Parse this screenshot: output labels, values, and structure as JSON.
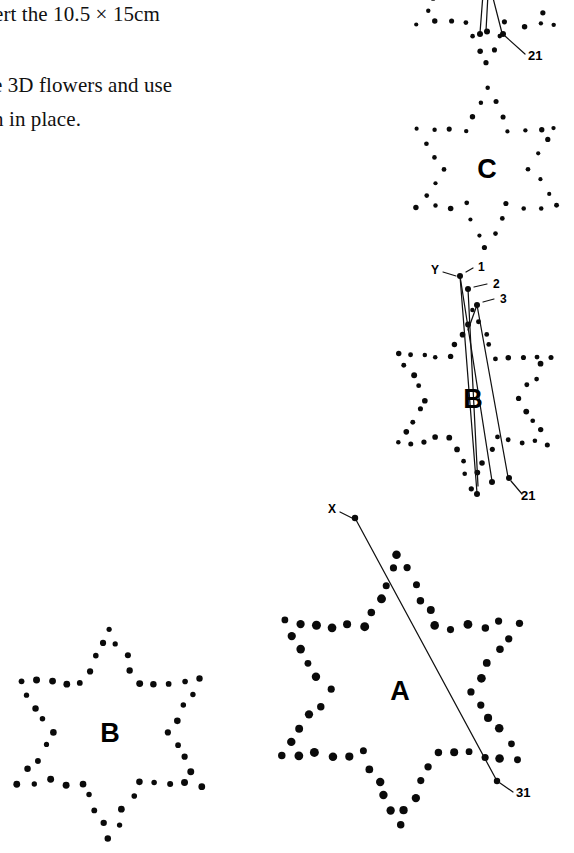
{
  "page": {
    "width": 574,
    "height": 853,
    "background": "#ffffff",
    "ink": "#0a0a0a"
  },
  "instructions": {
    "lines": [
      "ert the 10.5 × 15cm",
      "e 3D flowers and use",
      "n in place."
    ]
  },
  "shapes": [
    {
      "id": "star-top",
      "letter": "",
      "center": {
        "x": 487,
        "y": -14
      },
      "radius_outer": 78,
      "radius_inner": 42,
      "label_visible": false
    },
    {
      "id": "star-c",
      "letter": "C",
      "center": {
        "x": 487,
        "y": 168
      },
      "radius_outer": 80,
      "radius_inner": 43,
      "label_visible": true
    },
    {
      "id": "star-b-right",
      "letter": "B",
      "center": {
        "x": 473,
        "y": 398
      },
      "radius_outer": 88,
      "radius_inner": 47,
      "label_visible": true
    },
    {
      "id": "star-a",
      "letter": "A",
      "center": {
        "x": 400,
        "y": 690
      },
      "radius_outer": 135,
      "radius_inner": 72,
      "label_visible": true
    },
    {
      "id": "star-b-left",
      "letter": "B",
      "center": {
        "x": 110,
        "y": 732
      },
      "radius_outer": 104,
      "radius_inner": 57,
      "label_visible": true
    }
  ],
  "callouts": [
    {
      "id": "callout-21-top",
      "text": "21",
      "x": 528,
      "y": 60
    },
    {
      "id": "callout-y",
      "text": "Y",
      "x": 431,
      "y": 274
    },
    {
      "id": "callout-1",
      "text": "1",
      "x": 478,
      "y": 271
    },
    {
      "id": "callout-2",
      "text": "2",
      "x": 493,
      "y": 288
    },
    {
      "id": "callout-3",
      "text": "3",
      "x": 500,
      "y": 303
    },
    {
      "id": "callout-21-mid",
      "text": "21",
      "x": 521,
      "y": 500
    },
    {
      "id": "callout-x",
      "text": "X",
      "x": 328,
      "y": 513
    },
    {
      "id": "callout-31",
      "text": "31",
      "x": 516,
      "y": 797
    }
  ],
  "fold_lines": {
    "top_group_count": 3,
    "mid_group_count": 3,
    "a_line_count": 1
  }
}
